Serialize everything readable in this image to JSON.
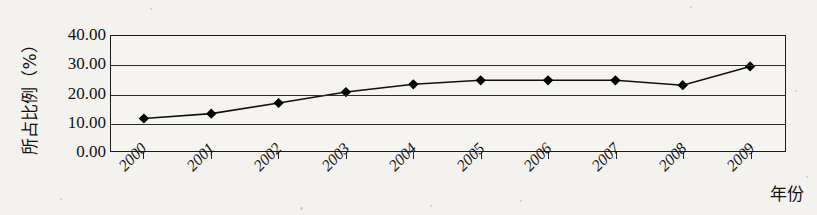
{
  "chart_data": {
    "type": "line",
    "title": "",
    "xlabel": "年份",
    "ylabel": "所占比例（%）",
    "categories": [
      "2000",
      "2001",
      "2002",
      "2003",
      "2004",
      "2005",
      "2006",
      "2007",
      "2008",
      "2009"
    ],
    "values": [
      11.3,
      13.0,
      16.7,
      20.5,
      23.2,
      24.6,
      24.6,
      24.6,
      22.9,
      29.4
    ],
    "series": [
      {
        "name": "所占比例",
        "values": [
          11.3,
          13.0,
          16.7,
          20.5,
          23.2,
          24.6,
          24.6,
          24.6,
          22.9,
          29.4
        ]
      }
    ],
    "ylim": [
      0,
      40
    ],
    "ytick_labels": [
      "0.00",
      "10.00",
      "20.00",
      "30.00",
      "40.00"
    ],
    "ytick_values": [
      0,
      10,
      20,
      30,
      40
    ],
    "grid": true,
    "legend": "none",
    "marker": "diamond",
    "line_color": "#111111",
    "marker_color": "#000000",
    "background_color": "#f4f2ef",
    "xtick_rotation": -45
  }
}
